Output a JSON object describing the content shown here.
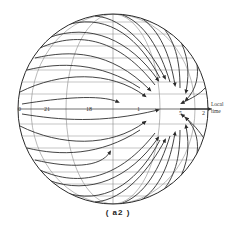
{
  "figure": {
    "caption": "( a2 )",
    "axis_label_line1": "Local",
    "axis_label_line2": "time",
    "equator_labels": [
      {
        "text": "0",
        "x": 18,
        "y": 106
      },
      {
        "text": "21",
        "x": 44,
        "y": 106
      },
      {
        "text": "18",
        "x": 86,
        "y": 106
      },
      {
        "text": "1",
        "x": 137,
        "y": 106
      },
      {
        "text": "5",
        "x": 179,
        "y": 106
      },
      {
        "text": "2",
        "x": 202,
        "y": 106
      }
    ],
    "sphere": {
      "cx": 113,
      "cy": 109,
      "r": 95
    },
    "colors": {
      "line": "#3a3a3a",
      "grid": "#8a8a8a",
      "background": "#ffffff"
    }
  }
}
